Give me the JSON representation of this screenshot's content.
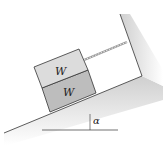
{
  "diagram": {
    "upper_block": {
      "label": "W",
      "fill": "#dcdcdc"
    },
    "lower_block": {
      "label": "W",
      "fill": "#bdbdbd"
    },
    "angle_label": "α",
    "colors": {
      "ground_shade": "#d6d6d6",
      "outline": "#333333",
      "rope": "#888888"
    }
  }
}
